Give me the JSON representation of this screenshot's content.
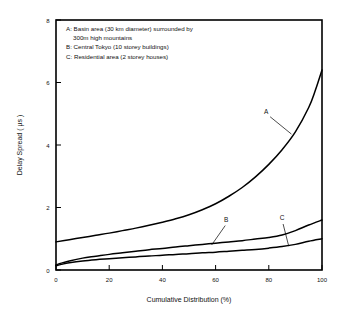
{
  "chart_data": {
    "type": "line",
    "title": "",
    "xlabel": "Cumulative Distribution (%)",
    "ylabel": "Delay Spread  ( µs )",
    "xlim": [
      0,
      100
    ],
    "ylim": [
      0,
      8
    ],
    "xticks": [
      "0",
      "20",
      "40",
      "60",
      "80",
      "100"
    ],
    "yticks": [
      "0",
      "2",
      "4",
      "6",
      "8"
    ],
    "grid": false,
    "legend_position": "inside-top-left",
    "annotations": [
      {
        "label": "A",
        "x": 79,
        "y": 5.0
      },
      {
        "label": "B",
        "x": 64,
        "y": 1.55
      },
      {
        "label": "C",
        "x": 85,
        "y": 1.6
      }
    ],
    "legend_lines": [
      "A: Basin area (30 km diameter) surrounded by",
      "300m high mountains",
      "B: Central Tokyo (10 storey buildings)",
      "C: Residential area (2 storey houses)"
    ],
    "series": [
      {
        "name": "A",
        "description": "Basin area (30 km diameter) surrounded by 300m high mountains",
        "x": [
          0,
          5,
          10,
          15,
          20,
          25,
          30,
          35,
          40,
          45,
          50,
          55,
          60,
          65,
          70,
          75,
          80,
          85,
          90,
          95,
          97.5,
          100
        ],
        "values": [
          0.9,
          0.97,
          1.04,
          1.11,
          1.18,
          1.26,
          1.34,
          1.43,
          1.53,
          1.64,
          1.77,
          1.93,
          2.12,
          2.36,
          2.64,
          2.98,
          3.38,
          3.85,
          4.42,
          5.2,
          5.75,
          6.4
        ]
      },
      {
        "name": "B",
        "description": "Central Tokyo (10 storey buildings)",
        "x": [
          0,
          2,
          5,
          10,
          15,
          20,
          25,
          30,
          35,
          40,
          45,
          50,
          55,
          60,
          65,
          70,
          75,
          80,
          85,
          90,
          95,
          100
        ],
        "values": [
          0.16,
          0.22,
          0.29,
          0.38,
          0.44,
          0.5,
          0.55,
          0.6,
          0.65,
          0.69,
          0.74,
          0.78,
          0.82,
          0.86,
          0.9,
          0.94,
          0.99,
          1.04,
          1.12,
          1.26,
          1.44,
          1.6
        ]
      },
      {
        "name": "C",
        "description": "Residential area (2 storey houses)",
        "x": [
          0,
          2,
          5,
          10,
          15,
          20,
          25,
          30,
          35,
          40,
          45,
          50,
          55,
          60,
          65,
          70,
          75,
          80,
          85,
          90,
          95,
          100
        ],
        "values": [
          0.14,
          0.18,
          0.23,
          0.29,
          0.33,
          0.36,
          0.39,
          0.42,
          0.45,
          0.47,
          0.5,
          0.52,
          0.55,
          0.57,
          0.6,
          0.63,
          0.66,
          0.7,
          0.75,
          0.82,
          0.92,
          1.0
        ]
      }
    ]
  }
}
